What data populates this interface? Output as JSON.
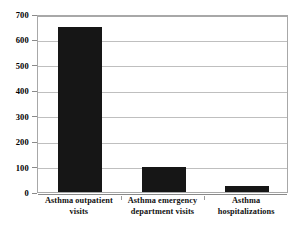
{
  "chart_data": {
    "type": "bar",
    "title": "",
    "xlabel": "",
    "ylabel": "",
    "categories": [
      "Asthma outpatient visits",
      "Asthma emergency department visits",
      "Asthma hospitalizations"
    ],
    "category_lines": [
      [
        "Asthma outpatient",
        "visits"
      ],
      [
        "Asthma emergency",
        "department visits"
      ],
      [
        "Asthma",
        "hospitalizations"
      ]
    ],
    "values": [
      650,
      100,
      25
    ],
    "ylim": [
      0,
      700
    ],
    "ytick_step": 100,
    "yticks": [
      0,
      100,
      200,
      300,
      400,
      500,
      600,
      700
    ],
    "ytick_labels": [
      "0",
      "100",
      "200",
      "300",
      "400",
      "500",
      "600",
      "700"
    ],
    "grid": true,
    "legend": false,
    "bar_color": "#161616",
    "gridline_color": "#bfbfbf",
    "axis_color": "#8a8a8a",
    "background_color": "#ffffff"
  }
}
